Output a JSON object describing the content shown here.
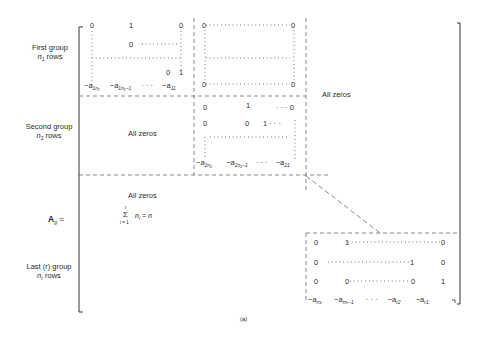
{
  "figure": {
    "caption": "(a)",
    "matrix_name": "A",
    "matrix_subscript": "g",
    "equals": "="
  },
  "row_labels": {
    "first": {
      "line1": "First group",
      "var": "n",
      "sub": "1",
      "suffix": " rows"
    },
    "second": {
      "line1": "Second group",
      "var": "n",
      "sub": "2",
      "suffix": " rows"
    },
    "last": {
      "line1": "Last (r) group",
      "var": "n",
      "sub": "r",
      "suffix": " rows"
    }
  },
  "block_labels": {
    "all_zeros_top_right": "All zeros",
    "all_zeros_second_left": "All zeros",
    "all_zeros_middle": "All zeros"
  },
  "sum_formula": {
    "sigma": "Σ",
    "upper": "r",
    "lower": "i = 1",
    "term": "n",
    "term_sub": "i",
    "rhs": "= n"
  },
  "block1": {
    "r1": [
      "0",
      "1",
      "0"
    ],
    "r2": [
      "0"
    ],
    "r_last": [
      "0",
      "1"
    ],
    "bottom": [
      "−a",
      "1n₁",
      "−a",
      "1n₁−1",
      "· · ·",
      "−a",
      "11"
    ]
  },
  "block1_right": {
    "corners": [
      "0",
      "0",
      "0",
      "0"
    ]
  },
  "block2": {
    "r1": [
      "0",
      "1",
      "· · · 0"
    ],
    "r2": [
      "0",
      "0",
      "1 · · ·"
    ],
    "bottom": [
      "−a",
      "2n₂",
      "−a",
      "2n₂−1",
      "· · ·",
      "−a",
      "21"
    ]
  },
  "block_r": {
    "r1": [
      "0",
      "1",
      "0"
    ],
    "r2": [
      "0",
      "1",
      "0"
    ],
    "r3": [
      "0",
      "0",
      "0",
      "1"
    ],
    "bottom": [
      "−a",
      "rnᵣ",
      "−a",
      "rnᵣ−1",
      "· · ·",
      "−a",
      "r2",
      "−a",
      "r1"
    ]
  }
}
